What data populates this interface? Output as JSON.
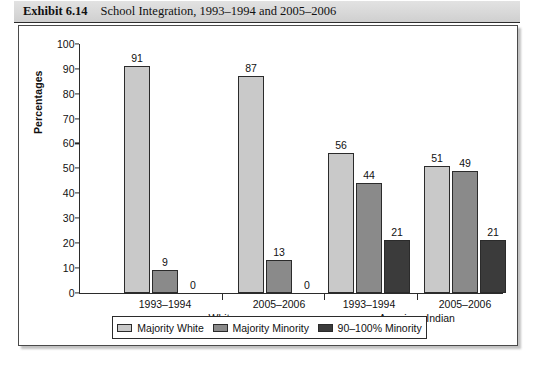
{
  "exhibit": {
    "label": "Exhibit 6.14",
    "caption": "School Integration, 1993–1994 and 2005–2006"
  },
  "colors": {
    "majority_white": "#c9c9c9",
    "majority_minority": "#8a8a8a",
    "minority_90_100": "#3b3b3b",
    "axis": "#2b2b2b",
    "title_bar": "#d8d8d8"
  },
  "chart_data": {
    "type": "bar",
    "title": "School Integration, 1993–1994 and 2005–2006",
    "xlabel": "",
    "ylabel": "Percentages",
    "ylim": [
      0,
      100
    ],
    "yticks": [
      0,
      10,
      20,
      30,
      40,
      50,
      60,
      70,
      80,
      90,
      100
    ],
    "grid": false,
    "legend_position": "bottom",
    "groups": [
      {
        "name": "White",
        "periods": [
          "1993–1994",
          "2005–2006"
        ]
      },
      {
        "name": "American Indian",
        "periods": [
          "1993–1994",
          "2005–2006"
        ]
      }
    ],
    "categories": [
      "White 1993–1994",
      "White 2005–2006",
      "American Indian 1993–1994",
      "American Indian 2005–2006"
    ],
    "series": [
      {
        "name": "Majority White",
        "color": "#c9c9c9",
        "values": [
          91,
          87,
          56,
          51
        ]
      },
      {
        "name": "Majority Minority",
        "color": "#8a8a8a",
        "values": [
          9,
          13,
          44,
          49
        ]
      },
      {
        "name": "90–100% Minority",
        "color": "#3b3b3b",
        "values": [
          0,
          0,
          21,
          21
        ]
      }
    ]
  },
  "legend": {
    "items": [
      {
        "label": "Majority White",
        "color": "#c9c9c9"
      },
      {
        "label": "Majority Minority",
        "color": "#8a8a8a"
      },
      {
        "label": "90–100% Minority",
        "color": "#3b3b3b"
      }
    ]
  }
}
